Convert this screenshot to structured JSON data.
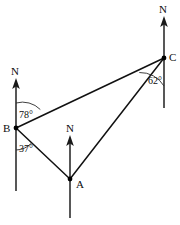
{
  "figure": {
    "background_color": "#ffffff",
    "line_color": "#111111",
    "width": 180,
    "height": 225
  },
  "points": [
    {
      "id": "A",
      "label": "A",
      "x": 70,
      "y": 179,
      "label_x": 76,
      "label_y": 188,
      "north_label": "N",
      "north_label_x": 66,
      "north_label_y": 132,
      "north_top_y": 136,
      "north_bottom_y": 218
    },
    {
      "id": "B",
      "label": "B",
      "x": 16,
      "y": 128,
      "label_x": 3,
      "label_y": 132,
      "north_label": "N",
      "north_label_x": 11,
      "north_label_y": 75,
      "north_top_y": 79,
      "north_bottom_y": 191
    },
    {
      "id": "C",
      "label": "C",
      "x": 164,
      "y": 58,
      "label_x": 169,
      "label_y": 61,
      "north_label": "N",
      "north_label_x": 159,
      "north_label_y": 13,
      "north_top_y": 17,
      "north_bottom_y": 108
    }
  ],
  "segments": [
    {
      "name": "segment-B-C",
      "from": "B",
      "to": "C"
    },
    {
      "name": "segment-B-A",
      "from": "B",
      "to": "A"
    },
    {
      "name": "segment-A-C",
      "from": "A",
      "to": "C"
    }
  ],
  "angles": [
    {
      "id": "angle-B-to-C",
      "value": "78°",
      "at_point": "B",
      "label_x": 19,
      "label_y": 118,
      "radius": 25,
      "start_deg": 0,
      "end_deg": 78
    },
    {
      "id": "angle-B-to-A",
      "value": "37°",
      "at_point": "B",
      "label_x": 19,
      "label_y": 152,
      "radius": 22,
      "start_deg": 135,
      "end_deg": 180
    },
    {
      "id": "angle-C-to-B",
      "value": "62°",
      "at_point": "C",
      "label_x": 148,
      "label_y": 84,
      "radius": 28,
      "start_deg": 180,
      "end_deg": 245
    }
  ]
}
